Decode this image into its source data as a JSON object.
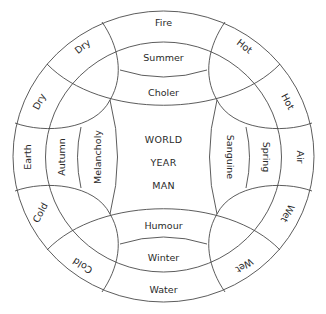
{
  "diagram": {
    "elements": {
      "outer": {
        "top": "Fire",
        "right": "Air",
        "bottom": "Water",
        "left": "Earth"
      },
      "qualities": {
        "top_left_a": "Dry",
        "top_left_b": "Dry",
        "top_right_a": "Hot",
        "top_right_b": "Hot",
        "bottom_right_a": "Wet",
        "bottom_right_b": "Wet",
        "bottom_left_a": "Cold",
        "bottom_left_b": "Cold"
      }
    },
    "seasons": {
      "top": "Summer",
      "right": "Spring",
      "bottom": "Winter",
      "left": "Autumn"
    },
    "humours": {
      "top": "Choler",
      "right": "Sanguine",
      "bottom": "Humour",
      "left": "Melancholy"
    },
    "center": {
      "line1": "WORLD",
      "line2": "YEAR",
      "line3": "MAN"
    },
    "colors": {
      "stroke": "#4a4a4a",
      "text": "#2a2a2a",
      "background": "#ffffff"
    }
  }
}
